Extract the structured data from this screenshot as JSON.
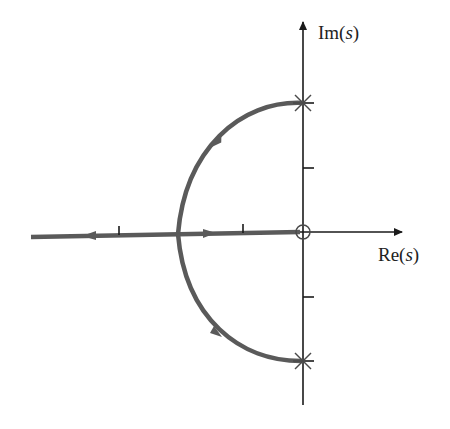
{
  "diagram": {
    "type": "root-locus",
    "axes": {
      "x_label": "Re(s)",
      "y_label": "Im(s)",
      "origin_px": [
        303,
        232
      ],
      "unit_px": 64
    },
    "ticks": {
      "real": [
        -1,
        -2
      ],
      "imag": [
        1,
        -1
      ]
    },
    "poles": [
      {
        "re": 0,
        "im": 2,
        "marker": "x"
      },
      {
        "re": 0,
        "im": -2,
        "marker": "x"
      }
    ],
    "zeros": [
      {
        "re": 0,
        "im": 0,
        "marker": "o"
      }
    ],
    "branches": [
      {
        "name": "upper-arc",
        "from": [
          0,
          2
        ],
        "to": [
          -2,
          0
        ],
        "shape": "semicircle-arc",
        "direction": "counterclockwise"
      },
      {
        "name": "lower-arc",
        "from": [
          0,
          -2
        ],
        "to": [
          -2,
          0
        ],
        "shape": "semicircle-arc",
        "direction": "clockwise"
      },
      {
        "name": "real-axis-to-zero",
        "from": [
          -2,
          0
        ],
        "to": [
          0,
          0
        ],
        "direction": "right"
      },
      {
        "name": "real-axis-to-infinity",
        "from": [
          -2,
          0
        ],
        "to": [
          -4.2,
          0
        ],
        "direction": "left"
      }
    ],
    "colors": {
      "locus": "#5a5a5a",
      "axes": "#1a1a1a",
      "background": "#ffffff"
    }
  },
  "labels": {
    "im_prefix": "Im(",
    "im_var": "s",
    "im_suffix": ")",
    "re_prefix": "Re(",
    "re_var": "s",
    "re_suffix": ")"
  }
}
